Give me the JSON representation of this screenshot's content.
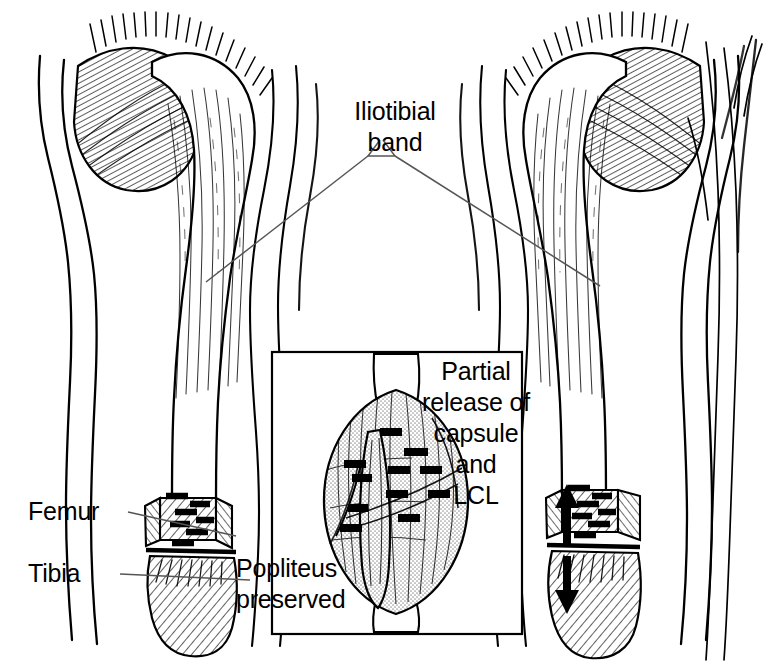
{
  "figure": {
    "kind": "medical-illustration",
    "width": 774,
    "height": 666,
    "background_color": "#ffffff",
    "ink_color": "#000000",
    "leader_line_color": "#555555",
    "capsule_stipple_color": "#b4b4b4"
  },
  "labels": {
    "iliotibial_band": "Iliotibial\nband",
    "femur": "Femur",
    "tibia": "Tibia",
    "partial_release": "Partial\nrelease of\ncapsule\nand\nLCL",
    "popliteus": "Popliteus\npreserved"
  },
  "panels": {
    "left_leg": {
      "name": "left-leg-view",
      "description": "Anterolateral view of knee with iliotibial band and femur/tibia labelled"
    },
    "right_leg": {
      "name": "right-leg-view",
      "description": "Same knee after release, with distraction arrows at the joint line"
    },
    "inset": {
      "name": "posterior-capsule-inset",
      "description": "Magnified posterior view of capsule showing pie-crust release marks and preserved popliteus",
      "box": {
        "x": 272,
        "y": 352,
        "width": 250,
        "height": 282
      }
    }
  },
  "annotations": {
    "distraction_arrows": {
      "up": "↑",
      "down": "↓",
      "count": 2
    },
    "release_marks_left_leg": 7,
    "release_marks_right_leg": 7,
    "release_marks_inset": 9
  }
}
